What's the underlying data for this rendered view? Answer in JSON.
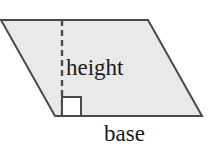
{
  "figure": {
    "name": "parallelogram-area-diagram",
    "shape": "parallelogram",
    "background_color": "#ffffff",
    "fill_color": "#e9e9e9",
    "stroke_color": "#4a4a4a",
    "stroke_width": 2,
    "vertices": {
      "top_left": [
        1,
        20
      ],
      "top_right": [
        148,
        20
      ],
      "bottom_right": [
        202,
        116
      ],
      "bottom_left": [
        55,
        116
      ]
    },
    "height_line": {
      "label": "height",
      "style": "dashed",
      "dash_length": 6,
      "dash_gap": 4,
      "x": 62,
      "y_start": 20,
      "y_end": 116,
      "color": "#4a4a4a"
    },
    "right_angle_marker": {
      "name": "right-angle-square",
      "x": 62,
      "y": 97,
      "size": 19,
      "fill": "#ffffff",
      "stroke": "#4a4a4a"
    },
    "base_edge": {
      "label": "base",
      "x_start": 55,
      "x_end": 202,
      "y": 116
    }
  },
  "labels": {
    "height": "height",
    "base": "base"
  }
}
